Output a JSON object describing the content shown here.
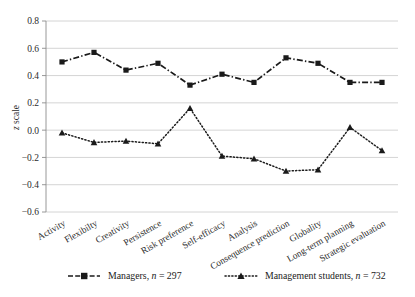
{
  "chart_data": {
    "type": "line",
    "title": "",
    "xlabel": "",
    "ylabel": "z scale",
    "ylim": [
      -0.6,
      0.8
    ],
    "yticks": [
      "0.8",
      "0.6",
      "0.4",
      "0.2",
      "0.0",
      "-0.2",
      "-0.4",
      "-0.6"
    ],
    "ytick_values": [
      0.8,
      0.6,
      0.4,
      0.2,
      0.0,
      -0.2,
      -0.4,
      -0.6
    ],
    "grid": true,
    "legend_position": "bottom",
    "categories": [
      "Activity",
      "Flexibilty",
      "Creativity",
      "Persistence",
      "Risk preference",
      "Self-efficacy",
      "Analysis",
      "Consequence prediction",
      "Globality",
      "Long-term planning",
      "Strategic evaluation"
    ],
    "series": [
      {
        "name": "Managers",
        "n": 297,
        "legend_text": "Managers, n = 297",
        "marker": "square",
        "linestyle": "dash-dot",
        "color": "#1a1a1a",
        "values": [
          0.5,
          0.57,
          0.44,
          0.49,
          0.33,
          0.41,
          0.35,
          0.53,
          0.49,
          0.35,
          0.35
        ]
      },
      {
        "name": "Management students",
        "n": 732,
        "legend_text": "Management students, n = 732",
        "marker": "triangle",
        "linestyle": "dotted",
        "color": "#1a1a1a",
        "values": [
          -0.02,
          -0.09,
          -0.08,
          -0.1,
          0.16,
          -0.19,
          -0.21,
          -0.3,
          -0.29,
          0.02,
          -0.15
        ]
      }
    ]
  },
  "legend": {
    "items": [
      {
        "label_main": "Managers,",
        "label_italic": "n",
        "label_tail": "= 297"
      },
      {
        "label_main": "Management students,",
        "label_italic": "n",
        "label_tail": "= 732"
      }
    ]
  },
  "axis": {
    "y_title_italic": "z",
    "y_title_rest": "scale"
  }
}
